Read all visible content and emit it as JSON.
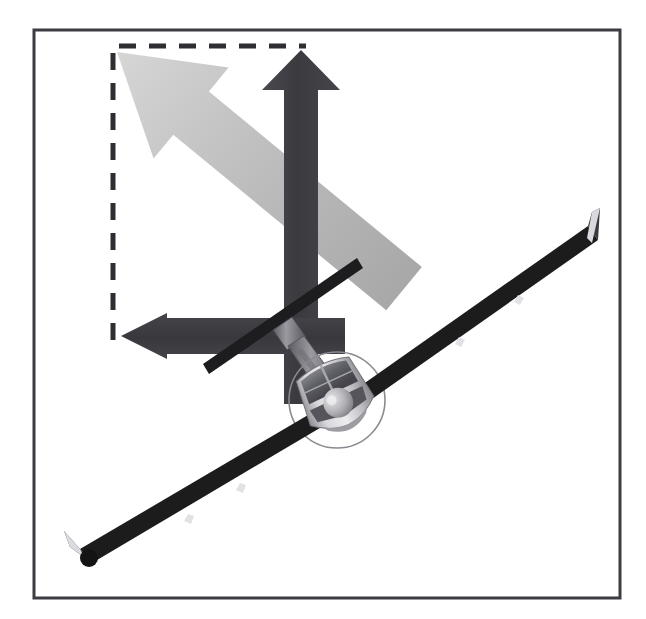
{
  "figure": {
    "title": "Lift vector resolved into vertical and horizontal components on a banked glider",
    "type": "force-vector-diagram",
    "canvas": {
      "width": 646,
      "height": 619,
      "background": "#ffffff"
    },
    "border_frame": {
      "name": "figure-border",
      "x": 34,
      "y": 30,
      "width": 586,
      "height": 568,
      "stroke": "#3c3c42",
      "stroke_width": 3,
      "fill": "#ffffff"
    },
    "dashed_box": {
      "name": "component-construction-box",
      "x": 113,
      "y": 46,
      "width": 192,
      "height": 294,
      "stroke": "#2e2e33",
      "stroke_width": 5,
      "dash": "17 13",
      "edges_drawn": [
        "top",
        "left"
      ]
    },
    "arrows": [
      {
        "id": "total-lift",
        "label": "LIFT",
        "label_visible": true,
        "label_color": "#ffffff",
        "direction": "up-left-diagonal",
        "color_start": "#b9b9b9",
        "color_end": "#d9d9d9",
        "tail": {
          "x": 400,
          "y": 383
        },
        "tip": {
          "x": 117,
          "y": 52
        },
        "shaft_width": 56,
        "head_width": 118,
        "head_length": 96,
        "rotation_deg": -50.5
      },
      {
        "id": "vertical-lift-component",
        "label": "",
        "label_visible": false,
        "direction": "up",
        "color": "#3b3b40",
        "tail": {
          "x": 301,
          "y": 400
        },
        "tip": {
          "x": 301,
          "y": 50
        },
        "shaft_width": 34,
        "head_width": 78,
        "head_length": 42
      },
      {
        "id": "horizontal-component",
        "label": "",
        "label_visible": false,
        "direction": "left",
        "color": "#3b3b40",
        "tail": {
          "x": 340,
          "y": 336
        },
        "tip": {
          "x": 121,
          "y": 336
        },
        "shaft_width": 36,
        "head_width": 80,
        "head_length": 46
      }
    ],
    "aircraft": {
      "name": "glider-front-view",
      "type": "sailplane",
      "attitude": "banked-left",
      "bank_angle_deg": -25,
      "wing_color": "#1c1c1c",
      "fuselage_color": "#b8b8b8",
      "canopy_color": "#6e6e74",
      "wing_left_tip": {
        "x": 66,
        "y": 563
      },
      "wing_right_tip": {
        "x": 598,
        "y": 213
      },
      "fuselage_center": {
        "x": 337,
        "y": 400
      },
      "prop_circle": {
        "cx": 337,
        "cy": 400,
        "r": 48
      },
      "winglets": 2,
      "underwing_fairings": 4,
      "tail": {
        "type": "T-tail",
        "fin_top": {
          "x": 290,
          "y": 327
        },
        "stabilizer_left": {
          "x": 205,
          "y": 363
        },
        "stabilizer_right": {
          "x": 356,
          "y": 259
        }
      }
    }
  }
}
